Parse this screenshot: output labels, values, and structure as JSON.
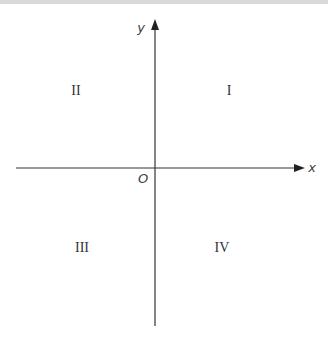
{
  "diagram": {
    "axes": {
      "x_label": "x",
      "y_label": "y",
      "origin_label": "O",
      "color": "#333333"
    },
    "quadrants": [
      {
        "id": "I",
        "label": "I"
      },
      {
        "id": "II",
        "label": "II"
      },
      {
        "id": "III",
        "label": "III"
      },
      {
        "id": "IV",
        "label": "IV"
      }
    ]
  }
}
